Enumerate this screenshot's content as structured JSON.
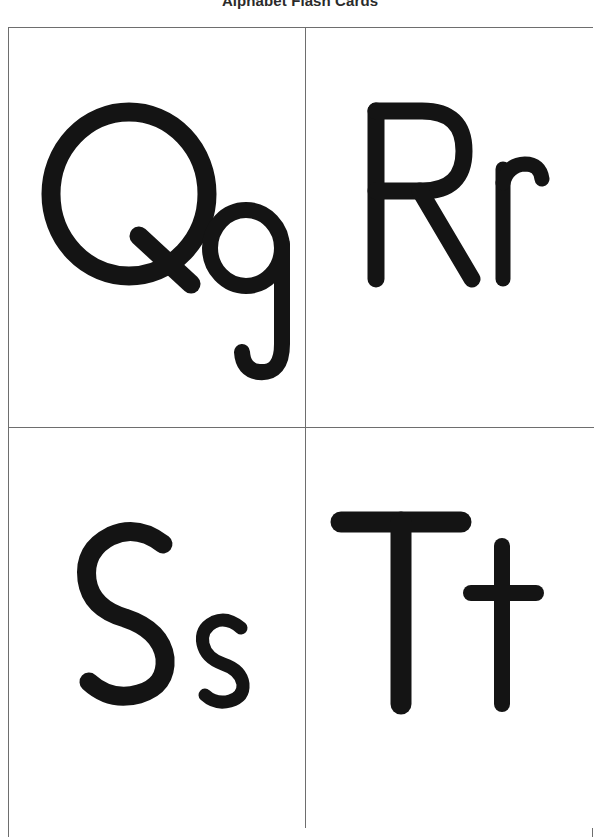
{
  "page": {
    "title": "Alphabet Flash Cards",
    "background_color": "#ffffff",
    "ink_color": "#141414",
    "border_color": "#6e6e6e",
    "title_color": "#2b2b2b"
  },
  "grid": {
    "columns": 2,
    "rows": 2,
    "cards": [
      {
        "position": "top-left",
        "uppercase": "Q",
        "lowercase": "q",
        "pair_label": "Qq",
        "icon": "handwritten-letter-qq"
      },
      {
        "position": "top-right",
        "uppercase": "R",
        "lowercase": "r",
        "pair_label": "Rr",
        "icon": "handwritten-letter-rr"
      },
      {
        "position": "bottom-left",
        "uppercase": "S",
        "lowercase": "s",
        "pair_label": "Ss",
        "icon": "handwritten-letter-ss"
      },
      {
        "position": "bottom-right",
        "uppercase": "T",
        "lowercase": "t",
        "pair_label": "Tt",
        "icon": "handwritten-letter-tt"
      }
    ]
  }
}
